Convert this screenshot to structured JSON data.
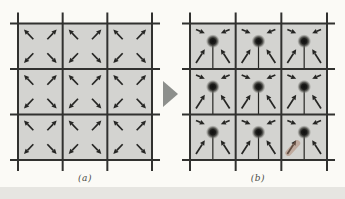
{
  "figure": {
    "panels": [
      {
        "label": "(a)",
        "rows": 3,
        "cols": 3,
        "arrow_direction": "outward",
        "center_dot": false,
        "stem": false
      },
      {
        "label": "(b)",
        "rows": 3,
        "cols": 3,
        "arrow_direction": "inward",
        "center_dot": true,
        "stem": true,
        "smudge_cell": {
          "row": 2,
          "col": 2
        }
      }
    ],
    "transition": {
      "icon": "right-triangle-arrow"
    },
    "colors": {
      "background": "#fbfaf6",
      "cell_fill": "#d3d3d0",
      "grid_line": "#31312f",
      "arrow": "#262624",
      "dot_core": "#0e0e0e",
      "dot_halo": "#77776f",
      "transition_arrow": "#8d8f8c",
      "label_text": "#4a4a46",
      "smudge": "#a97a62",
      "bottom_band": "#e6e5e1"
    }
  }
}
